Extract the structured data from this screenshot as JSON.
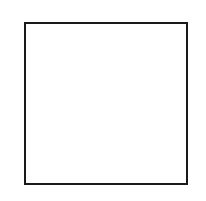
{
  "figure": {
    "title": "",
    "type": "radial-spoke-diagram-on-lattice",
    "canvas": {
      "width": 206,
      "height": 201,
      "background": "#ffffff"
    },
    "plot_box": {
      "x": 24,
      "y": 22,
      "width": 164,
      "height": 163,
      "border_color": "#1a1a1a",
      "border_width": 2,
      "fill": "#ffffff"
    },
    "lattice": {
      "description": "woven brick-lattice of light gray lines inside the plot box",
      "line_color": "#c8c8c8",
      "line_width": 2,
      "vertical_x": [
        43,
        62,
        81,
        100,
        119,
        138,
        157,
        176
      ],
      "horizontal_y": [
        41,
        59,
        77,
        95,
        113,
        131,
        149,
        167
      ]
    },
    "star": {
      "center": {
        "x": 104,
        "y": 103
      },
      "spoke_count": 8,
      "spoke_outline_color": "#000000",
      "spoke_fill_color": "#ffffff",
      "spoke_outline_width": 1.6,
      "spoke_half_width": 5.2,
      "spokes": [
        {
          "label": "1",
          "angle_deg": 288,
          "length": 76
        },
        {
          "label": "3",
          "angle_deg": 252,
          "length": 76
        },
        {
          "label": "5",
          "angle_deg": 207,
          "length": 76
        },
        {
          "label": "7",
          "angle_deg": 153,
          "length": 76
        },
        {
          "label": "9",
          "angle_deg": 108,
          "length": 76
        },
        {
          "label": "11",
          "angle_deg": 72,
          "length": 76
        },
        {
          "label": "13",
          "angle_deg": 27,
          "length": 76
        },
        {
          "label": "15",
          "angle_deg": 333,
          "length": 76
        }
      ]
    },
    "labels": [
      {
        "id": "label-9",
        "text": "9",
        "x": 60,
        "y": 6,
        "align": "center",
        "side": "top"
      },
      {
        "id": "label-11",
        "text": "11",
        "x": 130,
        "y": 6,
        "align": "center",
        "side": "top"
      },
      {
        "id": "label-7",
        "text": "7",
        "x": 12,
        "y": 62,
        "align": "center",
        "side": "left"
      },
      {
        "id": "label-13",
        "text": "13",
        "x": 187,
        "y": 57,
        "align": "center",
        "side": "right"
      },
      {
        "id": "label-5",
        "text": "5",
        "x": 12,
        "y": 131,
        "align": "center",
        "side": "left"
      },
      {
        "id": "label-15",
        "text": "15",
        "x": 190,
        "y": 128,
        "align": "center",
        "side": "right"
      },
      {
        "id": "label-3",
        "text": "3",
        "x": 64,
        "y": 181,
        "align": "center",
        "side": "bottom"
      },
      {
        "id": "label-1",
        "text": "1",
        "x": 144,
        "y": 181,
        "align": "center",
        "side": "bottom"
      }
    ]
  }
}
